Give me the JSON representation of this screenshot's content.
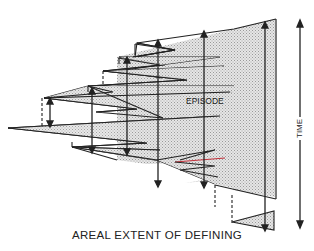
{
  "diagram": {
    "caption": "AREAL EXTENT OF DEFINING",
    "episode_label": "EPISODE",
    "time_axis_label": "TIME",
    "colors": {
      "line": "#222222",
      "fill_stipple": "#d4d4d4",
      "background": "#ffffff",
      "accent_red": "#c0303a"
    },
    "elements": [
      "stippled trapezoidal defining-episode block with time arrows",
      "stacked zigzag wedges stepping down-left",
      "dashed vertical connectors between wedge bases",
      "double-headed vertical TIME arrow on right",
      "small lower stippled triangle with dashed connector"
    ]
  }
}
